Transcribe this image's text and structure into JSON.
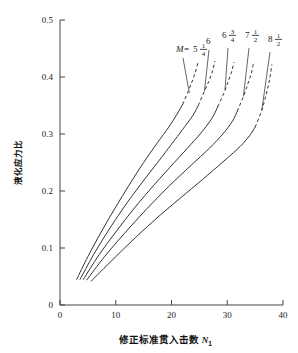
{
  "chart_data": {
    "type": "line",
    "title": "",
    "xlabel": "修正标准贯入击数 N₁",
    "xlabel_main": "修正标准贯入击数",
    "xlabel_symbol": "N",
    "xlabel_symbol_sub": "1",
    "ylabel": "液化应力比",
    "xlim": [
      0,
      40
    ],
    "ylim": [
      0,
      0.5
    ],
    "xticks": [
      "0",
      "10",
      "20",
      "30",
      "40"
    ],
    "xtick_values": [
      0,
      10,
      20,
      30,
      40
    ],
    "yticks": [
      "0",
      "0.1",
      "0.2",
      "0.3",
      "0.4",
      "0.5"
    ],
    "ytick_values": [
      0,
      0.1,
      0.2,
      0.3,
      0.4,
      0.5
    ],
    "grid": false,
    "legend_position": "in-plot-top-annotations",
    "legend_prefix": "M =",
    "series": [
      {
        "name": "M = 5 1/4",
        "label_whole": "5",
        "label_num": "1",
        "label_den": "4",
        "has_prefix": true,
        "solid": [
          [
            3.0,
            0.045
          ],
          [
            5.0,
            0.085
          ],
          [
            7.5,
            0.13
          ],
          [
            10.0,
            0.172
          ],
          [
            12.5,
            0.212
          ],
          [
            15.0,
            0.25
          ],
          [
            17.5,
            0.285
          ],
          [
            19.5,
            0.312
          ],
          [
            21.0,
            0.335
          ],
          [
            22.0,
            0.352
          ]
        ],
        "dashed": [
          [
            22.0,
            0.352
          ],
          [
            23.0,
            0.375
          ],
          [
            23.8,
            0.395
          ],
          [
            24.4,
            0.412
          ],
          [
            24.8,
            0.428
          ]
        ]
      },
      {
        "name": "M = 6",
        "label_whole": "6",
        "label_num": "",
        "label_den": "",
        "has_prefix": false,
        "solid": [
          [
            3.6,
            0.045
          ],
          [
            6.0,
            0.088
          ],
          [
            8.5,
            0.128
          ],
          [
            11.5,
            0.172
          ],
          [
            14.5,
            0.212
          ],
          [
            17.5,
            0.25
          ],
          [
            20.0,
            0.282
          ],
          [
            22.0,
            0.308
          ],
          [
            23.8,
            0.332
          ],
          [
            24.8,
            0.35
          ]
        ],
        "dashed": [
          [
            24.8,
            0.35
          ],
          [
            25.9,
            0.375
          ],
          [
            26.8,
            0.395
          ],
          [
            27.4,
            0.412
          ],
          [
            27.8,
            0.428
          ]
        ]
      },
      {
        "name": "M = 6 3/4",
        "label_whole": "6",
        "label_num": "3",
        "label_den": "4",
        "has_prefix": false,
        "solid": [
          [
            4.2,
            0.045
          ],
          [
            7.0,
            0.088
          ],
          [
            10.0,
            0.128
          ],
          [
            13.5,
            0.172
          ],
          [
            17.0,
            0.212
          ],
          [
            20.5,
            0.25
          ],
          [
            23.5,
            0.282
          ],
          [
            25.8,
            0.308
          ],
          [
            27.4,
            0.33
          ],
          [
            28.3,
            0.348
          ]
        ],
        "dashed": [
          [
            28.3,
            0.348
          ],
          [
            29.4,
            0.372
          ],
          [
            30.2,
            0.393
          ],
          [
            30.8,
            0.41
          ],
          [
            31.2,
            0.426
          ]
        ]
      },
      {
        "name": "M = 7 1/2",
        "label_whole": "7",
        "label_num": "1",
        "label_den": "2",
        "has_prefix": false,
        "solid": [
          [
            4.8,
            0.044
          ],
          [
            8.0,
            0.085
          ],
          [
            11.5,
            0.125
          ],
          [
            15.5,
            0.168
          ],
          [
            19.5,
            0.208
          ],
          [
            23.5,
            0.245
          ],
          [
            26.8,
            0.275
          ],
          [
            29.2,
            0.3
          ],
          [
            30.9,
            0.322
          ],
          [
            31.8,
            0.34
          ]
        ],
        "dashed": [
          [
            31.8,
            0.34
          ],
          [
            32.9,
            0.366
          ],
          [
            33.7,
            0.388
          ],
          [
            34.3,
            0.406
          ],
          [
            34.7,
            0.424
          ]
        ]
      },
      {
        "name": "M = 8 1/2",
        "label_whole": "8",
        "label_num": "1",
        "label_den": "2",
        "has_prefix": false,
        "solid": [
          [
            5.6,
            0.042
          ],
          [
            9.5,
            0.08
          ],
          [
            13.5,
            0.118
          ],
          [
            18.0,
            0.158
          ],
          [
            22.5,
            0.195
          ],
          [
            26.5,
            0.228
          ],
          [
            29.8,
            0.256
          ],
          [
            32.3,
            0.278
          ],
          [
            34.0,
            0.297
          ],
          [
            35.0,
            0.312
          ]
        ],
        "dashed": [
          [
            35.0,
            0.312
          ],
          [
            36.2,
            0.342
          ],
          [
            37.0,
            0.37
          ],
          [
            37.6,
            0.396
          ],
          [
            38.0,
            0.422
          ]
        ]
      }
    ],
    "annotations": [
      {
        "text": "M = 5 1/4",
        "points_to_curve": 0
      },
      {
        "text": "6",
        "points_to_curve": 1
      },
      {
        "text": "6 3/4",
        "points_to_curve": 2
      },
      {
        "text": "7 1/2",
        "points_to_curve": 3
      },
      {
        "text": "8 1/2",
        "points_to_curve": 4
      }
    ],
    "line_color": "#333333",
    "axis_color": "#444444"
  }
}
